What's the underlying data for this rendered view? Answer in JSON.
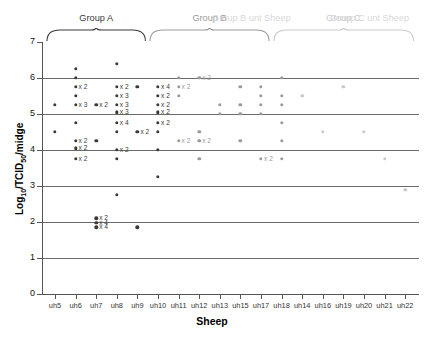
{
  "chart_data": {
    "type": "scatter",
    "title": "",
    "xlabel": "Sheep",
    "ylabel": "Log10/TCID50/midge",
    "ylabel_parts": {
      "base": "Log",
      "sub1": "10",
      "mid": "/TCID",
      "sub2": "50",
      "tail": "/midge"
    },
    "ylim": [
      0,
      7
    ],
    "yticks": [
      0,
      1,
      2,
      3,
      4,
      5,
      6,
      7
    ],
    "gridlines": [
      1,
      2,
      3,
      4,
      5,
      6
    ],
    "grid": true,
    "legend": null,
    "categories": [
      "uh5",
      "uh6",
      "uh7",
      "uh8",
      "uh9",
      "uh10",
      "uh11",
      "uh12",
      "uh13",
      "uh15",
      "uh17",
      "uh18",
      "uh14",
      "uh16",
      "uh19",
      "uh20",
      "uh21",
      "uh22"
    ],
    "groups": [
      {
        "label": "Group A",
        "color": "#3a3a3a",
        "categories": [
          "uh5",
          "uh6",
          "uh7",
          "uh8",
          "uh9"
        ]
      },
      {
        "label": "Group B",
        "color": "#9a9a9a",
        "categories": [
          "uh10",
          "uh11",
          "uh12",
          "uh13",
          "uh15",
          "uh17"
        ]
      },
      {
        "label": "Group C",
        "color": "#c9c9c9",
        "categories": [
          "uh18",
          "uh14",
          "uh16",
          "uh19",
          "uh20",
          "uh21",
          "uh22"
        ]
      }
    ],
    "ghost_labels": [
      "Group C unt Sheep"
    ],
    "series": [
      {
        "category": "uh5",
        "color": "#3a3a3a",
        "points": [
          {
            "y": 5.25,
            "n": 1
          },
          {
            "y": 4.5,
            "n": 1
          }
        ]
      },
      {
        "category": "uh6",
        "color": "#3a3a3a",
        "points": [
          {
            "y": 6.25,
            "n": 1
          },
          {
            "y": 6.0,
            "n": 1
          },
          {
            "y": 5.75,
            "n": 2
          },
          {
            "y": 5.5,
            "n": 1
          },
          {
            "y": 5.25,
            "n": 3
          },
          {
            "y": 4.75,
            "n": 1
          },
          {
            "y": 4.25,
            "n": 2
          },
          {
            "y": 4.05,
            "n": 2
          },
          {
            "y": 3.75,
            "n": 2
          }
        ]
      },
      {
        "category": "uh7",
        "color": "#3a3a3a",
        "points": [
          {
            "y": 5.25,
            "n": 2
          },
          {
            "y": 4.25,
            "n": 1
          },
          {
            "y": 2.1,
            "n": 2
          },
          {
            "y": 1.98,
            "n": 4
          },
          {
            "y": 1.85,
            "n": 4
          }
        ]
      },
      {
        "category": "uh8",
        "color": "#3a3a3a",
        "points": [
          {
            "y": 6.4,
            "n": 1
          },
          {
            "y": 5.75,
            "n": 2
          },
          {
            "y": 5.5,
            "n": 3
          },
          {
            "y": 5.25,
            "n": 3
          },
          {
            "y": 5.05,
            "n": 3
          },
          {
            "y": 4.75,
            "n": 4
          },
          {
            "y": 4.5,
            "n": 1
          },
          {
            "y": 4.0,
            "n": 2
          },
          {
            "y": 3.75,
            "n": 1
          },
          {
            "y": 2.75,
            "n": 1
          }
        ]
      },
      {
        "category": "uh9",
        "color": "#3a3a3a",
        "points": [
          {
            "y": 5.75,
            "n": 1
          },
          {
            "y": 4.5,
            "n": 2
          },
          {
            "y": 1.85,
            "n": 1
          }
        ]
      },
      {
        "category": "uh10",
        "color": "#3a3a3a",
        "points": [
          {
            "y": 5.75,
            "n": 4
          },
          {
            "y": 5.5,
            "n": 2
          },
          {
            "y": 5.25,
            "n": 2
          },
          {
            "y": 5.05,
            "n": 2
          },
          {
            "y": 4.75,
            "n": 2
          },
          {
            "y": 4.5,
            "n": 1
          },
          {
            "y": 4.0,
            "n": 1
          },
          {
            "y": 3.25,
            "n": 1
          }
        ]
      },
      {
        "category": "uh11",
        "color": "#9a9a9a",
        "points": [
          {
            "y": 6.0,
            "n": 1
          },
          {
            "y": 5.75,
            "n": 2
          },
          {
            "y": 5.5,
            "n": 1
          },
          {
            "y": 4.25,
            "n": 2
          }
        ]
      },
      {
        "category": "uh12",
        "color": "#9a9a9a",
        "points": [
          {
            "y": 6.0,
            "n": 2
          },
          {
            "y": 4.5,
            "n": 1
          },
          {
            "y": 4.25,
            "n": 2
          },
          {
            "y": 3.75,
            "n": 1
          }
        ]
      },
      {
        "category": "uh13",
        "color": "#9a9a9a",
        "points": [
          {
            "y": 5.25,
            "n": 1
          },
          {
            "y": 5.0,
            "n": 1
          }
        ]
      },
      {
        "category": "uh15",
        "color": "#9a9a9a",
        "points": [
          {
            "y": 5.75,
            "n": 1
          },
          {
            "y": 5.25,
            "n": 1
          },
          {
            "y": 5.0,
            "n": 1
          },
          {
            "y": 4.25,
            "n": 1
          }
        ]
      },
      {
        "category": "uh17",
        "color": "#9a9a9a",
        "points": [
          {
            "y": 5.75,
            "n": 1
          },
          {
            "y": 5.5,
            "n": 1
          },
          {
            "y": 5.25,
            "n": 1
          },
          {
            "y": 5.0,
            "n": 1
          },
          {
            "y": 3.75,
            "n": 2
          }
        ]
      },
      {
        "category": "uh18",
        "color": "#9a9a9a",
        "points": [
          {
            "y": 6.0,
            "n": 1
          },
          {
            "y": 5.5,
            "n": 1
          },
          {
            "y": 5.25,
            "n": 1
          },
          {
            "y": 4.75,
            "n": 1
          },
          {
            "y": 4.25,
            "n": 1
          },
          {
            "y": 3.75,
            "n": 1
          }
        ]
      },
      {
        "category": "uh14",
        "color": "#c9c9c9",
        "points": [
          {
            "y": 5.5,
            "n": 1
          }
        ]
      },
      {
        "category": "uh16",
        "color": "#c9c9c9",
        "points": [
          {
            "y": 4.5,
            "n": 1
          }
        ]
      },
      {
        "category": "uh19",
        "color": "#c9c9c9",
        "points": [
          {
            "y": 5.75,
            "n": 1
          }
        ]
      },
      {
        "category": "uh20",
        "color": "#c9c9c9",
        "points": [
          {
            "y": 4.5,
            "n": 1
          }
        ]
      },
      {
        "category": "uh21",
        "color": "#c9c9c9",
        "points": [
          {
            "y": 3.75,
            "n": 1
          }
        ]
      },
      {
        "category": "uh22",
        "color": "#c9c9c9",
        "points": [
          {
            "y": 2.9,
            "n": 1
          }
        ]
      }
    ],
    "multiplier_prefix": "x"
  }
}
